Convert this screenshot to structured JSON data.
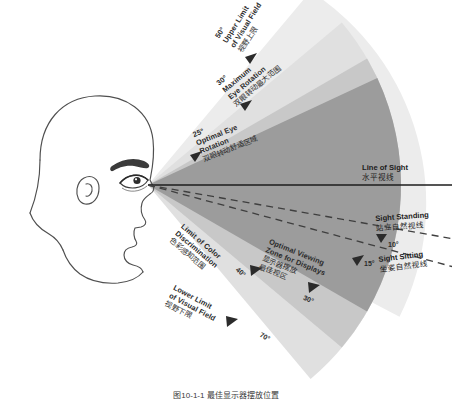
{
  "diagram": {
    "caption": "图10-1-1 最佳显示器摆放位置",
    "colors": {
      "wedge_inner": "#9a9a9a",
      "wedge_mid": "#c3c3c3",
      "wedge_outer": "#dedede",
      "wedge_outermost": "#ededed",
      "line": "#1d1d1d",
      "dashed": "#4a4a4a",
      "head_stroke": "#4d4d4d",
      "text": "#2b2b2b"
    }
  },
  "labels": {
    "upper_limit": {
      "angle": "50°",
      "en_line1": "Upper Limit",
      "en_line2": "of Visual Field",
      "cn": "视野上限"
    },
    "max_eye_rotation": {
      "angle": "30°",
      "en_line1": "Maximum",
      "en_line2": "Eye Rotation",
      "cn": "双眼转动最大范围"
    },
    "optimal_eye_rotation": {
      "angle": "25°",
      "en_line1": "Optimal Eye",
      "en_line2": "Rotation",
      "cn": "双眼转动舒适区域"
    },
    "line_of_sight": {
      "en": "Line of Sight",
      "cn": "水平视线"
    },
    "sight_standing": {
      "en": "Sight Standing",
      "cn": "站立自然视线",
      "angle": "10°"
    },
    "sight_sitting": {
      "en": "Sight Sitting",
      "cn": "坐姿自然视线",
      "angle": "15°"
    },
    "color_discrimination": {
      "angle": "40°",
      "en_line1": "Limit of Color",
      "en_line2": "Discrimination",
      "cn": "色彩感知范围"
    },
    "optimal_viewing_zone": {
      "angle": "30°",
      "en_line1": "Optimal Viewing",
      "en_line2": "Zone for Displays",
      "cn_line1": "显示器摆放",
      "cn_line2": "最佳视区"
    },
    "lower_limit": {
      "angle": "70°",
      "en_line1": "Lower Limit",
      "en_line2": "of Visual Field",
      "cn": "视野下限"
    }
  }
}
